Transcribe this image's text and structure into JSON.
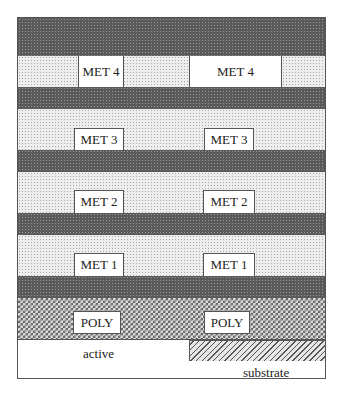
{
  "diagram": {
    "layers": [
      {
        "name": "oxide-top",
        "type": "dielectric"
      },
      {
        "name": "met4-level",
        "type": "metal-level",
        "label": "MET 4"
      },
      {
        "name": "oxide-4",
        "type": "dielectric"
      },
      {
        "name": "met3-level",
        "type": "metal-level",
        "label": "MET 3"
      },
      {
        "name": "oxide-3",
        "type": "dielectric"
      },
      {
        "name": "met2-level",
        "type": "metal-level",
        "label": "MET 2"
      },
      {
        "name": "oxide-2",
        "type": "dielectric"
      },
      {
        "name": "met1-level",
        "type": "metal-level",
        "label": "MET 1"
      },
      {
        "name": "oxide-1",
        "type": "dielectric"
      },
      {
        "name": "poly-level",
        "type": "poly-level",
        "label": "POLY"
      },
      {
        "name": "active-substrate",
        "type": "base"
      }
    ],
    "boxes": {
      "met4_left": "MET 4",
      "met4_right": "MET 4",
      "met3_left": "MET 3",
      "met3_right": "MET 3",
      "met2_left": "MET 2",
      "met2_right": "MET 2",
      "met1_left": "MET 1",
      "met1_right": "MET 1",
      "poly_left": "POLY",
      "poly_right": "POLY"
    },
    "region_labels": {
      "active": "active",
      "substrate": "substrate"
    },
    "colors": {
      "dielectric": "#5a5a5a",
      "metal_level": "#eeeeee",
      "poly_level": "#888888",
      "outline": "#555555"
    }
  }
}
